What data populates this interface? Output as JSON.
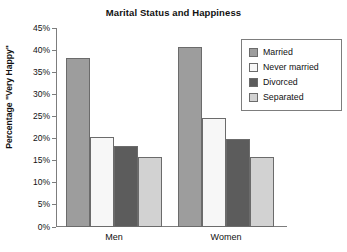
{
  "chart_data": {
    "type": "bar",
    "title": "Marital Status and Happiness",
    "xlabel": "",
    "ylabel": "Percentage \"Very Happy\"",
    "categories": [
      "Men",
      "Women"
    ],
    "series": [
      {
        "name": "Married",
        "values": [
          38.3,
          40.7
        ],
        "color": "#9d9d9d"
      },
      {
        "name": "Never married",
        "values": [
          20.4,
          24.6
        ],
        "color": "#f7f7f7"
      },
      {
        "name": "Divorced",
        "values": [
          18.3,
          19.8
        ],
        "color": "#5c5c5c"
      },
      {
        "name": "Separated",
        "values": [
          15.8,
          15.8
        ],
        "color": "#d2d2d2"
      }
    ],
    "ylim": [
      0,
      45
    ],
    "ytick_step": 5,
    "ytick_labels": [
      "0%",
      "5%",
      "10%",
      "15%",
      "20%",
      "25%",
      "30%",
      "35%",
      "40%",
      "45%"
    ],
    "grid": false,
    "legend_position": "top-right",
    "axis_color": "#7d7d7d",
    "bar_border_color": "#6b6b6b",
    "background": "#ffffff"
  }
}
